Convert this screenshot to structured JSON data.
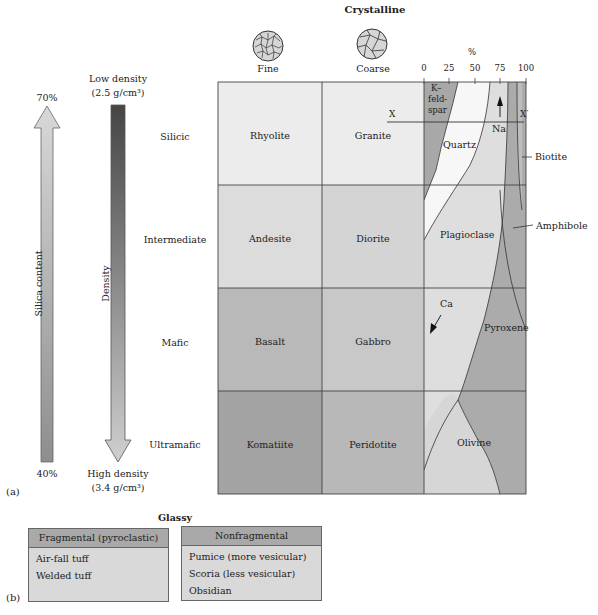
{
  "crystalline": {
    "title": "Crystalline",
    "texture_columns": [
      {
        "label": "Fine",
        "icon": "fine-texture-icon"
      },
      {
        "label": "Coarse",
        "icon": "coarse-texture-icon"
      }
    ],
    "percent_axis": {
      "unit": "%",
      "ticks": [
        "0",
        "25",
        "50",
        "75",
        "100"
      ]
    },
    "rows": [
      {
        "composition": "Silicic",
        "fine": "Rhyolite",
        "coarse": "Granite",
        "color": "#ececec"
      },
      {
        "composition": "Intermediate",
        "fine": "Andesite",
        "coarse": "Diorite",
        "color": "#dadada"
      },
      {
        "composition": "Mafic",
        "fine": "Basalt",
        "coarse": "Gabbro",
        "color": "#bdbdbd"
      },
      {
        "composition": "Ultramafic",
        "fine": "Komatiite",
        "coarse": "Peridotite",
        "color": "#a6a6a6"
      }
    ],
    "minerals": {
      "k_feldspar": "K–\nfeld-\nspar",
      "k_line1": "K–",
      "k_line2": "feld-",
      "k_line3": "spar",
      "quartz": "Quartz",
      "na": "Na",
      "biotite": "Biotite",
      "plagioclase": "Plagioclase",
      "amphibole": "Amphibole",
      "ca": "Ca",
      "pyroxene": "Pyroxene",
      "olivine": "Olivine",
      "x": "X",
      "x_prime": "X′"
    }
  },
  "silica_axis": {
    "label": "Silica content",
    "top": "70%",
    "bottom": "40%"
  },
  "density_axis": {
    "label": "Density",
    "top_line1": "Low density",
    "top_line2": "(2.5 g/cm³)",
    "bottom_line1": "High density",
    "bottom_line2": "(3.4 g/cm³)"
  },
  "panel_labels": {
    "a": "(a)",
    "b": "(b)"
  },
  "glassy": {
    "title": "Glassy",
    "fragmental": {
      "header": "Fragmental (pyroclastic)",
      "items": [
        "Air-fall tuff",
        "Welded tuff"
      ]
    },
    "nonfragmental": {
      "header": "Nonfragmental",
      "items": [
        "Pumice (more vesicular)",
        "Scoria (less vesicular)",
        "Obsidian"
      ]
    }
  },
  "colors": {
    "silicic": "#ececec",
    "intermediate": "#dadada",
    "mafic": "#bdbdbd",
    "ultramafic": "#a6a6a6",
    "quartz": "#f7f7f7",
    "k_feldspar": "#a8a8a8",
    "plagioclase": "#dedede",
    "mafic_minerals": "#ababab",
    "density_top": "#4a4a4a",
    "density_bottom": "#c8c8c8"
  }
}
